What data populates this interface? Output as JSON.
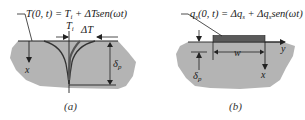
{
  "panel_a": {
    "equation": "T(0, t) = T",
    "equation_sub": "i",
    "equation_rest": " + ΔTsen(ωt)",
    "ti_label": "T",
    "ti_sub": "i",
    "delta_t_label": "ΔT",
    "x_label": "x",
    "delta_label": "δ",
    "delta_sub": "p",
    "caption": "(a)"
  },
  "panel_b": {
    "equation": "q",
    "equation_sub": "s",
    "equation_mid": "(0, t) = Δq",
    "equation_sub2": "s",
    "equation_rest": " + Δq",
    "equation_sub3": "s",
    "equation_end": "sen(ωt)",
    "w_label": "w",
    "y_label": "y",
    "x_label": "x",
    "delta_label": "δ",
    "delta_sub": "p",
    "caption": "(b)"
  },
  "colors": {
    "medium": "#b4b4b4",
    "heater": "#5a5a5a",
    "line": "#222222"
  }
}
